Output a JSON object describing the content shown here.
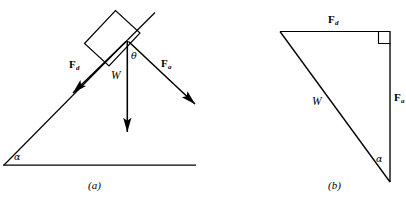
{
  "figure": {
    "type": "physics-force-diagram",
    "stroke_color": "#000000",
    "background_color": "#ffffff",
    "panels": [
      {
        "id": "a",
        "caption": "(a)",
        "description": "Block on an inclined plane with force vectors",
        "labels": {
          "force_down_incline": "F",
          "force_down_incline_sub": "d",
          "weight": "W",
          "force_applied": "F",
          "force_applied_sub": "a",
          "angle_incline": "α",
          "angle_theta": "θ"
        }
      },
      {
        "id": "b",
        "caption": "(b)",
        "description": "Force triangle showing vector sum",
        "labels": {
          "force_down_incline": "F",
          "force_down_incline_sub": "d",
          "weight": "W",
          "force_applied": "F",
          "force_applied_sub": "a",
          "angle_incline": "α"
        }
      }
    ]
  }
}
